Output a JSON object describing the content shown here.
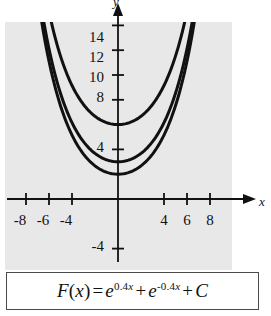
{
  "figure": {
    "name": "exponential-antiderivative-family-graph",
    "background_color": "#e8e8e8",
    "curve_color": "#111111"
  },
  "axes": {
    "y_letter": "y",
    "x_letter": "x",
    "x_tick_labels": [
      "-8",
      "-6",
      "-4",
      "4",
      "6",
      "8"
    ],
    "y_tick_labels": [
      "14",
      "12",
      "10",
      "8",
      "4",
      "-4"
    ]
  },
  "formula": {
    "lhs_f": "F",
    "lhs_paren_open": "(",
    "lhs_x": "x",
    "lhs_paren_close": ")",
    "equals": "=",
    "term1_base": "e",
    "term1_exp_num": "0.4",
    "term1_exp_var": "x",
    "plus1": "+",
    "term2_base": "e",
    "term2_exp_num": "-0.4",
    "term2_exp_var": "x",
    "plus2": "+",
    "constant": "C"
  },
  "chart_data": {
    "type": "line",
    "title": "",
    "subtitle": "",
    "xlabel": "x",
    "ylabel": "y",
    "xlim": [
      -9.5,
      9.6
    ],
    "ylim": [
      -5.5,
      15.5
    ],
    "x_ticks": [
      -8,
      -6,
      -4,
      4,
      6,
      8
    ],
    "y_ticks": [
      14,
      12,
      10,
      8,
      4,
      -4
    ],
    "grid": false,
    "legend": "none",
    "function_family": "F(x) = e^(0.4x) + e^(-0.4x) + C",
    "series": [
      {
        "name": "C = 4",
        "constant": 4,
        "minimum": {
          "x": 0,
          "y": 6
        },
        "color": "#111111",
        "x": [
          -9.5,
          -9,
          -8,
          -7,
          -6,
          -5,
          -4,
          -3,
          -2,
          -1,
          0,
          1,
          2,
          3,
          4,
          5,
          6,
          7,
          8,
          9,
          9.5
        ],
        "y": [
          48.9,
          40.6,
          28.6,
          20.6,
          15.2,
          11.5,
          9.0,
          7.4,
          6.5,
          6.1,
          6.0,
          6.1,
          6.5,
          7.4,
          9.0,
          11.5,
          15.2,
          20.6,
          28.6,
          40.6,
          48.9
        ]
      },
      {
        "name": "C = 1",
        "constant": 1,
        "minimum": {
          "x": 0,
          "y": 3
        },
        "color": "#111111",
        "x": [
          -9.5,
          -9,
          -8,
          -7,
          -6,
          -5,
          -4,
          -3,
          -2,
          -1,
          0,
          1,
          2,
          3,
          4,
          5,
          6,
          7,
          8,
          9,
          9.5
        ],
        "y": [
          45.9,
          37.6,
          25.6,
          17.6,
          12.2,
          8.5,
          6.0,
          4.4,
          3.5,
          3.1,
          3.0,
          3.1,
          3.5,
          4.4,
          6.0,
          8.5,
          12.2,
          17.6,
          25.6,
          37.6,
          45.9
        ]
      },
      {
        "name": "C = 0",
        "constant": 0,
        "minimum": {
          "x": 0,
          "y": 2
        },
        "color": "#111111",
        "x": [
          -9.5,
          -9,
          -8,
          -7,
          -6,
          -5,
          -4,
          -3,
          -2,
          -1,
          0,
          1,
          2,
          3,
          4,
          5,
          6,
          7,
          8,
          9,
          9.5
        ],
        "y": [
          44.9,
          36.6,
          24.6,
          16.6,
          11.2,
          7.5,
          5.0,
          3.4,
          2.5,
          2.1,
          2.0,
          2.1,
          2.5,
          3.4,
          5.0,
          7.5,
          11.2,
          16.6,
          24.6,
          36.6,
          44.9
        ]
      }
    ]
  }
}
